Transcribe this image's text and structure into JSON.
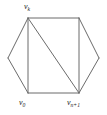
{
  "figure": {
    "name": "hexagon-triangulation-diagram",
    "background_color": "#ffffff",
    "stroke_color": "#6b6b6b",
    "label_color": "#1a1a1a",
    "stroke_width": 1,
    "width": 107,
    "height": 115
  },
  "labels": {
    "top": {
      "base": "v",
      "sub": "k",
      "full": "v_k"
    },
    "bottom_left": {
      "base": "v",
      "sub": "0",
      "full": "v_0"
    },
    "bottom_right": {
      "base": "v",
      "sub": "n+1",
      "full": "v_n+1"
    }
  },
  "chart_data": {
    "type": "diagram",
    "title": "",
    "subtitle": "",
    "xlabel": "",
    "ylabel": "",
    "grid": false,
    "legend": "none",
    "xlim": [
      0,
      107
    ],
    "ylim": [
      0,
      115
    ],
    "nodes": [
      {
        "id": "left",
        "x": 8,
        "y": 58,
        "label": "",
        "label_pos": "none"
      },
      {
        "id": "top_left",
        "x": 28,
        "y": 18,
        "label": "v_k",
        "label_pos": "above"
      },
      {
        "id": "top_right",
        "x": 79,
        "y": 18,
        "label": "",
        "label_pos": "none"
      },
      {
        "id": "right",
        "x": 99,
        "y": 58,
        "label": "",
        "label_pos": "none"
      },
      {
        "id": "bottom_right",
        "x": 79,
        "y": 93,
        "label": "v_n+1",
        "label_pos": "below"
      },
      {
        "id": "bottom_left",
        "x": 28,
        "y": 93,
        "label": "v_0",
        "label_pos": "below"
      }
    ],
    "edges": [
      {
        "from": "left",
        "to": "top_left",
        "kind": "boundary"
      },
      {
        "from": "top_left",
        "to": "top_right",
        "kind": "boundary"
      },
      {
        "from": "top_right",
        "to": "right",
        "kind": "boundary"
      },
      {
        "from": "right",
        "to": "bottom_right",
        "kind": "boundary"
      },
      {
        "from": "bottom_right",
        "to": "bottom_left",
        "kind": "boundary"
      },
      {
        "from": "bottom_left",
        "to": "left",
        "kind": "boundary"
      },
      {
        "from": "top_left",
        "to": "bottom_left",
        "kind": "chord"
      },
      {
        "from": "top_right",
        "to": "bottom_right",
        "kind": "chord"
      },
      {
        "from": "top_left",
        "to": "bottom_right",
        "kind": "chord"
      }
    ]
  }
}
